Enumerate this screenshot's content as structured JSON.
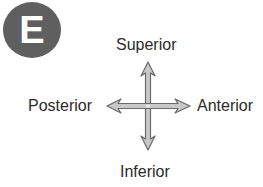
{
  "panel": {
    "letter": "E",
    "badge_color": "#5f5f5f"
  },
  "directions": {
    "superior": "Superior",
    "inferior": "Inferior",
    "posterior": "Posterior",
    "anterior": "Anterior"
  },
  "arrow_colors": {
    "fill": "#c8c8c8",
    "stroke": "#6a6a6a"
  }
}
